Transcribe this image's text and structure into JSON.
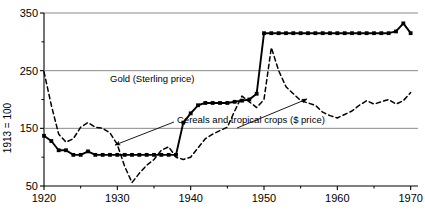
{
  "chart_data": {
    "type": "line",
    "title": "",
    "xlabel": "",
    "ylabel": "1913 = 100",
    "xlim": [
      1920,
      1971
    ],
    "ylim": [
      50,
      350
    ],
    "xticks": [
      1920,
      1930,
      1940,
      1950,
      1960,
      1970
    ],
    "xticklabels": [
      "1920",
      "1930",
      "1940",
      "1950",
      "1960",
      "1970"
    ],
    "xminorticks": [
      1925,
      1935,
      1945,
      1955,
      1965
    ],
    "yticks": [
      50,
      150,
      250,
      350
    ],
    "yticklabels": [
      "50",
      "150",
      "250",
      "350"
    ],
    "yminorticks": [
      100,
      200,
      300
    ],
    "gridlines": [
      150,
      250
    ],
    "grid": true,
    "legend_position": "inline-annotation",
    "series": [
      {
        "name": "Gold (Sterling price)",
        "style": "solid-with-square-markers",
        "color": "#000000",
        "label_text": "Gold (Sterling price)",
        "x": [
          1920,
          1921,
          1922,
          1923,
          1924,
          1925,
          1926,
          1927,
          1928,
          1929,
          1930,
          1931,
          1932,
          1933,
          1934,
          1935,
          1936,
          1937,
          1938,
          1939,
          1940,
          1941,
          1942,
          1943,
          1944,
          1945,
          1946,
          1947,
          1948,
          1949,
          1950,
          1951,
          1952,
          1953,
          1954,
          1955,
          1956,
          1957,
          1958,
          1959,
          1960,
          1961,
          1962,
          1963,
          1964,
          1965,
          1966,
          1967,
          1968,
          1969,
          1970
        ],
        "y": [
          137,
          128,
          112,
          112,
          104,
          104,
          110,
          104,
          104,
          104,
          104,
          104,
          104,
          104,
          104,
          104,
          104,
          104,
          104,
          160,
          176,
          190,
          194,
          194,
          194,
          194,
          196,
          198,
          200,
          210,
          315,
          315,
          315,
          315,
          315,
          315,
          315,
          315,
          315,
          315,
          315,
          315,
          315,
          315,
          315,
          315,
          315,
          315,
          318,
          332,
          315
        ]
      },
      {
        "name": "Cereals and tropical crops ($ price)",
        "style": "dashed",
        "color": "#000000",
        "label_text": "Cereals and tropical crops ($ price)",
        "x": [
          1920,
          1921,
          1922,
          1923,
          1924,
          1925,
          1926,
          1927,
          1928,
          1929,
          1930,
          1931,
          1932,
          1933,
          1934,
          1935,
          1936,
          1937,
          1938,
          1939,
          1940,
          1941,
          1942,
          1943,
          1944,
          1945,
          1946,
          1947,
          1948,
          1949,
          1950,
          1951,
          1952,
          1953,
          1954,
          1955,
          1956,
          1957,
          1958,
          1959,
          1960,
          1961,
          1962,
          1963,
          1964,
          1965,
          1966,
          1967,
          1968,
          1969,
          1970
        ],
        "y": [
          248,
          190,
          140,
          126,
          132,
          152,
          160,
          152,
          150,
          142,
          122,
          84,
          56,
          72,
          86,
          96,
          112,
          118,
          100,
          96,
          100,
          116,
          132,
          140,
          146,
          152,
          180,
          206,
          196,
          186,
          200,
          290,
          250,
          222,
          210,
          198,
          194,
          190,
          178,
          172,
          168,
          174,
          180,
          190,
          198,
          192,
          196,
          200,
          192,
          198,
          212
        ]
      }
    ],
    "annotations": [
      {
        "name": "gold-label",
        "text": "Gold (Sterling price)",
        "x_px": 110,
        "y_px": 82
      },
      {
        "name": "cereals-label",
        "text": "Cereals and tropical crops ($ price)",
        "x_px": 177,
        "y_px": 123
      },
      {
        "name": "arrow-left",
        "from_px": [
          174,
          122
        ],
        "to_px": [
          115,
          145
        ]
      },
      {
        "name": "arrow-right",
        "from_px": [
          237,
          128
        ],
        "to_px": [
          307,
          99
        ]
      }
    ]
  },
  "axes": {
    "y_title": "1913 = 100",
    "y_ticklabels": [
      "350",
      "250",
      "150",
      "50"
    ],
    "x_ticklabels": [
      "1920",
      "1930",
      "1940",
      "1950",
      "1960",
      "1970"
    ]
  },
  "colors": {
    "ink": "#000000",
    "grid": "#8a8a8a",
    "background": "#ffffff"
  }
}
